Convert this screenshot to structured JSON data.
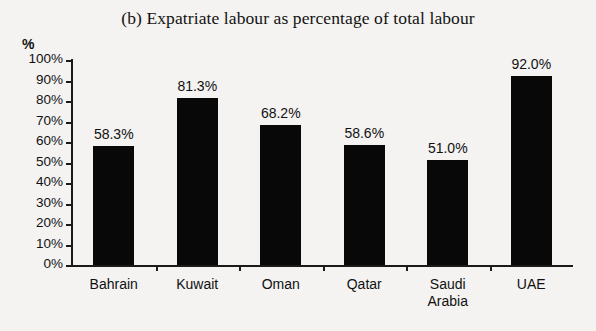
{
  "chart_data": {
    "type": "bar",
    "title": "(b) Expatriate labour as percentage of total labour",
    "xlabel": "",
    "ylabel": "%",
    "ylim": [
      0,
      100
    ],
    "grid": false,
    "legend": null,
    "categories": [
      "Bahrain",
      "Kuwait",
      "Oman",
      "Qatar",
      "Saudi Arabia",
      "UAE"
    ],
    "values": [
      58.3,
      81.3,
      68.2,
      58.6,
      51.0,
      92.0
    ],
    "data_labels": [
      "58.3%",
      "81.3%",
      "68.2%",
      "58.6%",
      "51.0%",
      "92.0%"
    ],
    "y_ticks": [
      0,
      10,
      20,
      30,
      40,
      50,
      60,
      70,
      80,
      90,
      100
    ],
    "y_tick_labels": [
      "0%",
      "10%",
      "20%",
      "30%",
      "40%",
      "50%",
      "60%",
      "70%",
      "80%",
      "90%",
      "100%"
    ],
    "bar_color": "#080808",
    "background_color": "#f4f3f1",
    "axis_color": "#1a1a1a"
  }
}
